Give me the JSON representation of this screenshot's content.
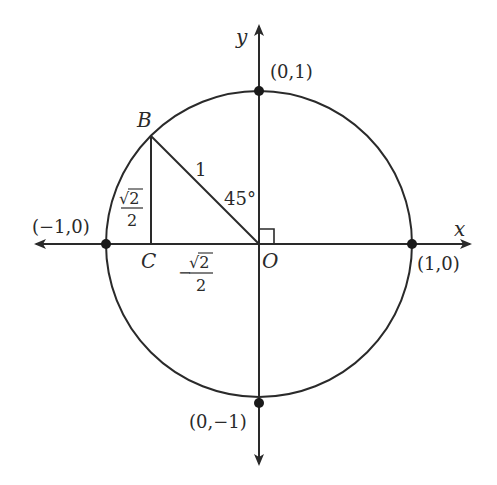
{
  "diagram": {
    "type": "unit-circle",
    "colors": {
      "stroke": "#2a2a2a",
      "background": "#ffffff"
    },
    "axes": {
      "x_label": "x",
      "y_label": "y"
    },
    "points": {
      "origin": "O",
      "B": "B",
      "C": "C",
      "right": "(1,0)",
      "left": "(−1,0)",
      "top": "(0,1)",
      "bottom": "(0,−1)"
    },
    "labels": {
      "hypotenuse": "1",
      "angle": "45°",
      "vertical_leg_num": "√2",
      "vertical_leg_den": "2",
      "horizontal_leg_sign": "−",
      "horizontal_leg_num": "√2",
      "horizontal_leg_den": "2"
    }
  }
}
